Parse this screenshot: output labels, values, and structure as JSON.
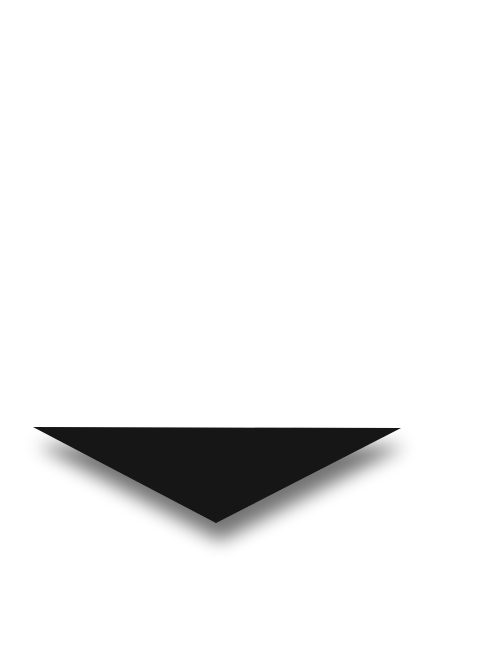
{
  "canvas": {
    "width": 484,
    "height": 666,
    "background": "#ffffff"
  },
  "shape": {
    "icon": "down-triangle-arrow-icon",
    "fill": "#131313",
    "shadow_color": "#000000",
    "shadow_opacity": 0.55,
    "points": {
      "left": [
        33,
        427
      ],
      "right": [
        401,
        428
      ],
      "apex": [
        216,
        523
      ]
    }
  }
}
